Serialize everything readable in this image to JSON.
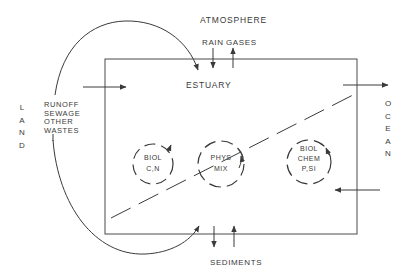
{
  "diagram": {
    "title_top": "ATMOSPHERE",
    "atmosphere_fluxes": [
      "RAIN",
      "GASES"
    ],
    "box_label": "ESTUARY",
    "left_side": {
      "label_letters": [
        "L",
        "A",
        "N",
        "D"
      ],
      "inputs": [
        "RUNOFF",
        "SEWAGE",
        "OTHER",
        "WASTES"
      ]
    },
    "right_side": {
      "label_letters": [
        "O",
        "C",
        "E",
        "A",
        "N"
      ]
    },
    "bottom_label": "SEDIMENTS",
    "cycles": [
      {
        "id": "biol-cn",
        "lines": [
          "BIOL",
          "C,N"
        ]
      },
      {
        "id": "phys-mix",
        "lines": [
          "PHYS",
          "MIX"
        ]
      },
      {
        "id": "biol-chem",
        "lines": [
          "BIOL",
          "CHEM",
          "P,SI"
        ]
      }
    ],
    "colors": {
      "line": "#3a3a3a",
      "background": "#ffffff"
    }
  }
}
